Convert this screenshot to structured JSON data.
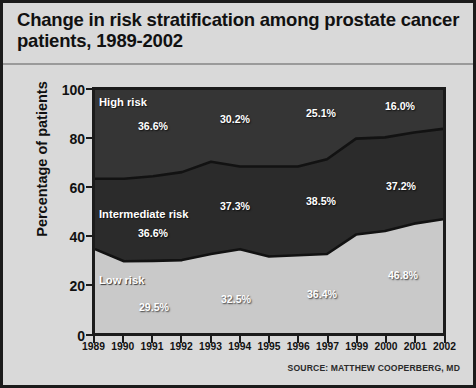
{
  "title": "Change in risk stratification among prostate cancer patients, 1989-2002",
  "source": "SOURCE: MATTHEW COOPERBERG, MD",
  "axes": {
    "ylabel": "Percentage of patients",
    "yticks": [
      "0",
      "20",
      "40",
      "60",
      "80",
      "100"
    ],
    "xticks": [
      "1989",
      "1990",
      "1991",
      "1992",
      "1993",
      "1994",
      "1995",
      "1996",
      "1997",
      "1999",
      "2000",
      "2001",
      "2002"
    ]
  },
  "bands": {
    "high": {
      "name": "High risk",
      "color": "#353535"
    },
    "intermediate": {
      "name": "Intermediate risk",
      "color": "#2b2b2b"
    },
    "low": {
      "name": "Low risk",
      "color": "#c9c9c9"
    }
  },
  "labels": {
    "high": [
      {
        "text": "36.6%",
        "year": "1990"
      },
      {
        "text": "30.2%",
        "year": "1993"
      },
      {
        "text": "25.1%",
        "year": "1996"
      },
      {
        "text": "16.0%",
        "year": "2000"
      }
    ],
    "intermediate": [
      {
        "text": "36.6%",
        "year": "1990"
      },
      {
        "text": "37.3%",
        "year": "1993"
      },
      {
        "text": "38.5%",
        "year": "1996"
      },
      {
        "text": "37.2%",
        "year": "2000"
      }
    ],
    "low": [
      {
        "text": "29.5%",
        "year": "1990"
      },
      {
        "text": "32.5%",
        "year": "1993"
      },
      {
        "text": "36.4%",
        "year": "1996"
      },
      {
        "text": "46.8%",
        "year": "2001"
      }
    ]
  },
  "chart_data": {
    "type": "area",
    "stacked": true,
    "title": "Change in risk stratification among prostate cancer patients, 1989-2002",
    "xlabel": "",
    "ylabel": "Percentage of patients",
    "ylim": [
      0,
      100
    ],
    "yticks": [
      0,
      20,
      40,
      60,
      80,
      100
    ],
    "grid": false,
    "legend": "in-plot band labels",
    "categories": [
      "1989",
      "1990",
      "1991",
      "1992",
      "1993",
      "1994",
      "1995",
      "1996",
      "1997",
      "1999",
      "2000",
      "2001",
      "2002"
    ],
    "series": [
      {
        "name": "Low risk",
        "color": "#c9c9c9",
        "values": [
          34.5,
          29.5,
          29.7,
          30.0,
          32.5,
          34.5,
          31.5,
          32.0,
          32.5,
          40.5,
          42.0,
          45.0,
          46.8
        ]
      },
      {
        "name": "Intermediate risk",
        "color": "#2b2b2b",
        "values": [
          29.0,
          34.0,
          34.8,
          36.2,
          38.0,
          34.0,
          37.0,
          36.5,
          39.0,
          39.5,
          38.5,
          37.5,
          37.2
        ]
      },
      {
        "name": "High risk",
        "color": "#353535",
        "values": [
          36.5,
          36.5,
          35.5,
          33.8,
          29.5,
          31.5,
          31.5,
          31.5,
          28.5,
          20.0,
          19.5,
          17.5,
          16.0
        ]
      }
    ],
    "cumulative_low": [
      34.5,
      29.5,
      29.7,
      30.0,
      32.5,
      34.5,
      31.5,
      32.0,
      32.5,
      40.5,
      42.0,
      45.0,
      46.8
    ],
    "cumulative_low_plus_mid": [
      63.5,
      63.5,
      64.5,
      66.2,
      70.5,
      68.5,
      68.5,
      68.5,
      71.5,
      80.0,
      80.5,
      82.5,
      84.0
    ],
    "annotations": [
      "High risk 36.6% (1990)",
      "High risk 30.2% (1993)",
      "High risk 25.1% (1996)",
      "High risk 16.0% (2000)",
      "Intermediate risk 36.6% (1990)",
      "Intermediate risk 37.3% (1993)",
      "Intermediate risk 38.5% (1996)",
      "Intermediate risk 37.2% (2000)",
      "Low risk 29.5% (1990)",
      "Low risk 32.5% (1993)",
      "Low risk 36.4% (1996)",
      "Low risk 46.8% (2001)"
    ]
  }
}
